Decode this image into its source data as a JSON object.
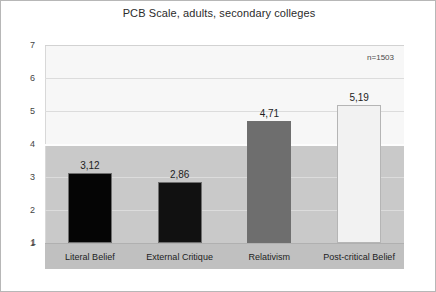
{
  "chart_data": {
    "type": "bar",
    "title": "PCB Scale, adults, secondary colleges",
    "categories": [
      "Literal Belief",
      "External Critique",
      "Relativism",
      "Post-critical Belief"
    ],
    "values": [
      3.12,
      2.86,
      4.71,
      5.19
    ],
    "value_labels": [
      "3,12",
      "2,86",
      "4,71",
      "5,19"
    ],
    "bar_colors": [
      "#050505",
      "#111111",
      "#6e6e6e",
      "#f2f2f2"
    ],
    "xlabel": "",
    "ylabel": "",
    "ylim": [
      1,
      7
    ],
    "yticks": [
      1,
      2,
      3,
      4,
      5,
      6,
      7
    ],
    "ytick_labels": [
      "1",
      "2",
      "3",
      "4",
      "5",
      "6",
      "7"
    ],
    "grid": true,
    "legend": false,
    "annotations": [
      {
        "text": "n=1503",
        "position": "top-right"
      }
    ],
    "plot_background": "#f7f7f7",
    "shade_background": "#c9c9c9",
    "category_band_background": "#c0c0c0"
  }
}
